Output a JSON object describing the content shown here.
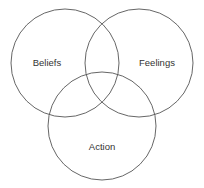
{
  "diagram": {
    "type": "venn",
    "sets": [
      {
        "label": "Beliefs",
        "cx": 65,
        "cy": 63,
        "r": 54,
        "label_x": 47,
        "label_y": 63
      },
      {
        "label": "Feelings",
        "cx": 139,
        "cy": 63,
        "r": 54,
        "label_x": 157,
        "label_y": 63
      },
      {
        "label": "Action",
        "cx": 102,
        "cy": 126,
        "r": 54,
        "label_x": 102,
        "label_y": 147
      }
    ],
    "stroke_color": "#555555",
    "text_color": "#333333"
  }
}
